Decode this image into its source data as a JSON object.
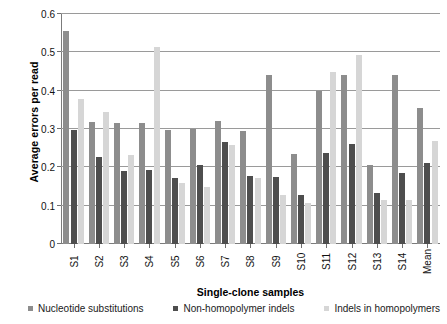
{
  "chart_data": {
    "type": "bar",
    "title": "",
    "xlabel": "Single-clone samples",
    "ylabel": "Average errors per read",
    "ylim": [
      0,
      0.6
    ],
    "ytick_labels": [
      "0",
      "0.1",
      "0.2",
      "0.3",
      "0.4",
      "0.5",
      "0.6"
    ],
    "ytick_values": [
      0,
      0.1,
      0.2,
      0.3,
      0.4,
      0.5,
      0.6
    ],
    "grid": true,
    "legend_position": "bottom",
    "categories": [
      "S1",
      "S2",
      "S3",
      "S4",
      "S5",
      "S6",
      "S7",
      "S8",
      "S9",
      "S10",
      "S11",
      "S12",
      "S13",
      "S14",
      "Mean"
    ],
    "series": [
      {
        "name": "Nucleotide substitutions",
        "color": "#8d8d8d",
        "values": [
          0.555,
          0.318,
          0.315,
          0.315,
          0.298,
          0.3,
          0.32,
          0.295,
          0.44,
          0.235,
          0.4,
          0.442,
          0.205,
          0.44,
          0.355
        ]
      },
      {
        "name": "Non-homopolymer indels",
        "color": "#4e4e4e",
        "values": [
          0.298,
          0.228,
          0.19,
          0.192,
          0.172,
          0.205,
          0.265,
          0.178,
          0.175,
          0.128,
          0.238,
          0.262,
          0.132,
          0.185,
          0.212
        ]
      },
      {
        "name": "Indels in homopolymers",
        "color": "#d6d6d6",
        "values": [
          0.378,
          0.345,
          0.232,
          0.515,
          0.158,
          0.148,
          0.258,
          0.172,
          0.128,
          0.108,
          0.448,
          0.492,
          0.115,
          0.115,
          0.268
        ]
      }
    ]
  }
}
